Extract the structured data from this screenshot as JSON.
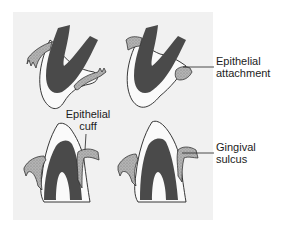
{
  "figure": {
    "panels": [
      {
        "id": "top-left",
        "description": "upper tooth crown with gingiva"
      },
      {
        "id": "top-right",
        "description": "upper tooth crown with epithelial attachment"
      },
      {
        "id": "bottom-left",
        "description": "lower tooth crown with epithelial cuff"
      },
      {
        "id": "bottom-right",
        "description": "lower tooth crown with gingival sulcus"
      }
    ],
    "labels": {
      "epithelial_attachment": {
        "line1": "Epithelial",
        "line2": "attachment"
      },
      "epithelial_cuff": {
        "line1": "Epithelial",
        "line2": "cuff"
      },
      "gingival_sulcus": {
        "line1": "Gingival",
        "line2": "sulcus"
      }
    },
    "colors": {
      "panel_bg": "#f1f1f1",
      "dentin": "#4a4a4a",
      "enamel": "#fafafa",
      "gingiva": "#a9a9a9",
      "outline": "#222222",
      "text": "#1c1c1c"
    }
  }
}
